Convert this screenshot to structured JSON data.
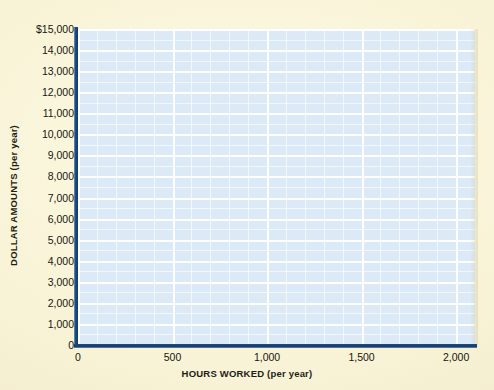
{
  "chart_data": {
    "type": "line",
    "title": "",
    "subtitle": "",
    "xlabel_bold": "HOURS WORKED",
    "xlabel_paren": "(per year)",
    "ylabel_bold": "DOLLAR AMOUNTS",
    "ylabel_paren": "(per year)",
    "x": [],
    "series": [],
    "xlim": [
      0,
      2100
    ],
    "ylim": [
      0,
      15000
    ],
    "xticks": [
      0,
      500,
      1000,
      1500,
      2000
    ],
    "xticklabels": [
      "0",
      "500",
      "1,000",
      "1,500",
      "2,000"
    ],
    "yticks": [
      0,
      1000,
      2000,
      3000,
      4000,
      5000,
      6000,
      7000,
      8000,
      9000,
      10000,
      11000,
      12000,
      13000,
      14000,
      15000
    ],
    "yticklabels": [
      "0",
      "1,000",
      "2,000",
      "3,000",
      "4,000",
      "5,000",
      "6,000",
      "7,000",
      "8,000",
      "9,000",
      "10,000",
      "11,000",
      "12,000",
      "13,000",
      "14,000",
      "$15,000"
    ],
    "grid": true,
    "grid_major_x_step": 500,
    "grid_minor_x_step": 100,
    "grid_major_y_step": 1000,
    "grid_minor_y_step": 500,
    "legend": [],
    "annotations": [],
    "plot_background_color": "#dce9f7",
    "grid_line_color": "#ffffff",
    "axis_line_color": "#143a66",
    "page_background_color": "#f7f2d5",
    "text_color": "#17170f"
  }
}
